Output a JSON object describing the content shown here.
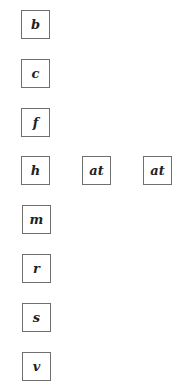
{
  "tiles": [
    {
      "label": "b",
      "x": 21,
      "y": 10
    },
    {
      "label": "c",
      "x": 21,
      "y": 59
    },
    {
      "label": "f",
      "x": 21,
      "y": 108
    },
    {
      "label": "h",
      "x": 21,
      "y": 156
    },
    {
      "label": "at",
      "x": 82,
      "y": 156
    },
    {
      "label": "at",
      "x": 143,
      "y": 156
    },
    {
      "label": "m",
      "x": 22,
      "y": 205
    },
    {
      "label": "r",
      "x": 22,
      "y": 254
    },
    {
      "label": "s",
      "x": 22,
      "y": 303
    },
    {
      "label": "v",
      "x": 22,
      "y": 352
    }
  ]
}
